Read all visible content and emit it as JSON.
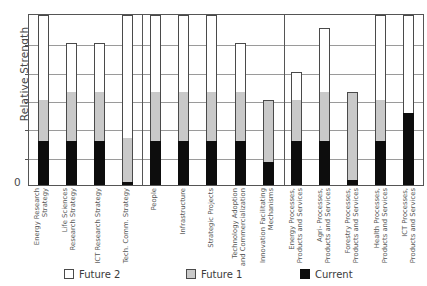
{
  "chart_data": {
    "type": "bar",
    "subtype": "stacked-bar",
    "title": "",
    "xlabel": "",
    "ylabel": "Relative Strength",
    "ylim": [
      0,
      6
    ],
    "ytick_labels": [
      "0"
    ],
    "grid": true,
    "gridlines": [
      1,
      2,
      3,
      4,
      5
    ],
    "legend_position": "bottom",
    "categories": [
      "Energy Research\nStrategy",
      "Life Sciences\nResearch Strategy",
      "ICT Research Strategy",
      "Tech. Comm. Strategy",
      "People",
      "Infrastructure",
      "Strategic Projects",
      "Technology Adoption\nand Commercialization",
      "Innovation Facilitating\nMechanisms",
      "Energy Processes,\nProducts and Services",
      "Agri- Processes,\nProducts and Services",
      "Forestry Processes,\nProducts and Services",
      "Health Processes,\nProducts and Services",
      "ICT Processes,\nProducts and Services"
    ],
    "groups": [
      {
        "label": "",
        "start": 0,
        "end": 3
      },
      {
        "label": "",
        "start": 4,
        "end": 8
      },
      {
        "label": "",
        "start": 9,
        "end": 13
      }
    ],
    "series": [
      {
        "name": "Current",
        "color": "#0d0d0d",
        "values": [
          1.55,
          1.55,
          1.55,
          0.1,
          1.55,
          1.55,
          1.55,
          1.55,
          0.8,
          1.55,
          1.55,
          0.18,
          1.55,
          2.55
        ]
      },
      {
        "name": "Future 1",
        "color": "#c9c9c9",
        "values": [
          1.45,
          1.75,
          1.75,
          1.55,
          1.75,
          1.75,
          1.75,
          1.75,
          2.2,
          1.45,
          1.75,
          3.1,
          1.45,
          0.0
        ]
      },
      {
        "name": "Future 2",
        "color": "#ffffff",
        "values": [
          3.0,
          1.7,
          1.7,
          4.35,
          2.7,
          2.7,
          2.7,
          1.7,
          0.0,
          1.0,
          2.25,
          0.0,
          3.0,
          3.45
        ]
      }
    ],
    "totals": [
      6.0,
      5.0,
      5.0,
      6.0,
      6.0,
      6.0,
      6.0,
      5.0,
      3.0,
      4.0,
      5.55,
      3.28,
      6.0,
      6.0
    ]
  },
  "legend": {
    "items": [
      {
        "label": "Future 2",
        "swatch": "white-square-icon"
      },
      {
        "label": "Future 1",
        "swatch": "gray-square-icon"
      },
      {
        "label": "Current",
        "swatch": "black-square-icon"
      }
    ]
  }
}
